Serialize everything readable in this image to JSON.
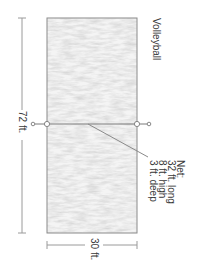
{
  "diagram": {
    "title": "Volleyball",
    "court": {
      "length_label": "72 ft.",
      "width_label": "30 ft.",
      "fill_color": "#d9d9d9",
      "border_color": "#8a8a8a"
    },
    "net": {
      "heading": "Net:",
      "lines": [
        "32 ft. long",
        "8 ft. high",
        "3 ft. deep"
      ],
      "line_color": "#7a7a7a"
    }
  }
}
